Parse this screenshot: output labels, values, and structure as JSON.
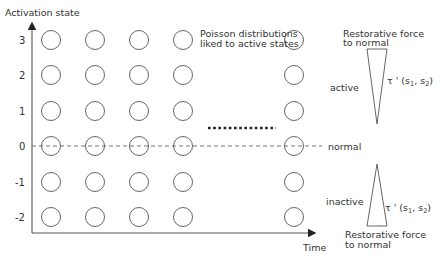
{
  "diagram": {
    "y_axis_label": "Activation state",
    "x_axis_label": "Time",
    "y_ticks": [
      "3",
      "2",
      "1",
      "0",
      "-1",
      "-2"
    ],
    "normal_label": "normal",
    "poisson_note": {
      "line1": "Poisson distributions",
      "line2": "liked to active states"
    },
    "active_region": {
      "label": "active",
      "force_line1": "Restorative force",
      "force_line2": "to normal",
      "tau_label": "τ '  (s",
      "sub1": "1",
      "sep": ", s",
      "sub2": "2",
      "close": ")"
    },
    "inactive_region": {
      "label": "inactive",
      "force_line1": "Restorative force",
      "force_line2": "to normal",
      "tau_label": "τ '  (s",
      "sub1": "1",
      "sep": ", s",
      "sub2": "2",
      "close": ")"
    },
    "grid": {
      "columns_x": [
        51,
        95,
        139,
        183,
        294
      ],
      "rows_y": [
        40,
        75,
        111,
        146,
        182,
        217
      ],
      "radius": 9.5
    },
    "colors": {
      "stroke": "#555555",
      "text": "#333333",
      "dots": "#222222"
    }
  }
}
